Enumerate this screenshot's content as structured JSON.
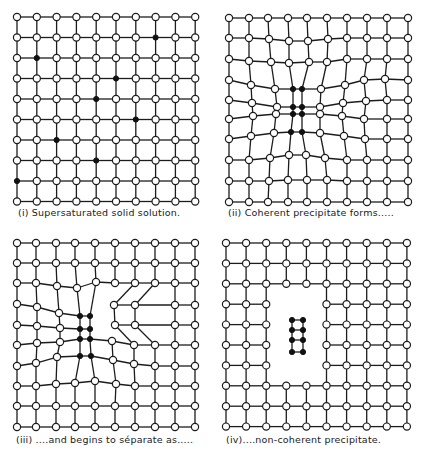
{
  "figure": {
    "colors": {
      "line": "#1c1c1c",
      "solvent_atom_fill": "#ffffff",
      "solute_atom_fill": "#111111",
      "background": "#ffffff"
    },
    "panels": [
      {
        "id": "i",
        "caption": "(i) Supersaturated solid solution.",
        "caption_pos": [
          18,
          207
        ],
        "type": "regular",
        "origin": [
          17,
          17
        ],
        "step": [
          19.8,
          20.5
        ],
        "cols": 10,
        "rows": 10,
        "solute_atoms": [
          [
            7,
            1
          ],
          [
            1,
            2
          ],
          [
            5,
            3
          ],
          [
            4,
            4
          ],
          [
            6,
            5
          ],
          [
            2,
            6
          ],
          [
            4,
            7
          ],
          [
            0,
            8
          ]
        ],
        "missing": []
      },
      {
        "id": "ii",
        "caption": "(ii) Coherent precipitate forms.....",
        "caption_pos": [
          228,
          207
        ],
        "type": "custom",
        "nodes": [
          [
            [
              229,
              18
            ],
            [
              249,
              18
            ],
            [
              268,
              18
            ],
            [
              288,
              18
            ],
            [
              307,
              18
            ],
            [
              327,
              18
            ],
            [
              347,
              18
            ],
            [
              367,
              18
            ],
            [
              387,
              18
            ],
            [
              408,
              18
            ]
          ],
          [
            [
              229,
              38
            ],
            [
              249,
              38
            ],
            [
              269,
              39
            ],
            [
              289,
              41
            ],
            [
              308,
              41
            ],
            [
              328,
              39
            ],
            [
              347,
              38
            ],
            [
              367,
              38
            ],
            [
              387,
              38
            ],
            [
              408,
              38
            ]
          ],
          [
            [
              229,
              59
            ],
            [
              249,
              61
            ],
            [
              271,
              62
            ],
            [
              289,
              63
            ],
            [
              309,
              62
            ],
            [
              327,
              62
            ],
            [
              347,
              59
            ],
            [
              367,
              59
            ],
            [
              387,
              59
            ],
            [
              408,
              59
            ]
          ],
          [
            [
              229,
              80
            ],
            [
              251,
              85
            ],
            [
              275,
              89
            ],
            [
              293,
              89
            ],
            [
              302,
              89
            ],
            [
              321,
              89
            ],
            [
              345,
              85
            ],
            [
              364,
              80
            ],
            [
              385,
              79
            ],
            [
              408,
              80
            ]
          ],
          [
            [
              229,
              100
            ],
            [
              252,
              103
            ],
            [
              277,
              107
            ],
            [
              293,
              107
            ],
            [
              302,
              107
            ],
            [
              320,
              107
            ],
            [
              343,
              103
            ],
            [
              366,
              101
            ],
            [
              387,
              100
            ],
            [
              408,
              100
            ]
          ],
          [
            [
              229,
              119
            ],
            [
              253,
              116
            ],
            [
              276,
              114
            ],
            [
              293,
              114
            ],
            [
              302,
              114
            ],
            [
              320,
              114
            ],
            [
              342,
              116
            ],
            [
              364,
              119
            ],
            [
              387,
              119
            ],
            [
              408,
              119
            ]
          ],
          [
            [
              229,
              139
            ],
            [
              251,
              136
            ],
            [
              274,
              133
            ],
            [
              291,
              132
            ],
            [
              302,
              132
            ],
            [
              320,
              133
            ],
            [
              344,
              136
            ],
            [
              365,
              139
            ],
            [
              387,
              139
            ],
            [
              408,
              139
            ]
          ],
          [
            [
              229,
              160
            ],
            [
              249,
              160
            ],
            [
              270,
              158
            ],
            [
              289,
              155
            ],
            [
              306,
              155
            ],
            [
              325,
              158
            ],
            [
              347,
              160
            ],
            [
              367,
              160
            ],
            [
              387,
              160
            ],
            [
              408,
              160
            ]
          ],
          [
            [
              229,
              181
            ],
            [
              249,
              181
            ],
            [
              269,
              181
            ],
            [
              288,
              180
            ],
            [
              307,
              180
            ],
            [
              327,
              180
            ],
            [
              347,
              181
            ],
            [
              367,
              181
            ],
            [
              387,
              181
            ],
            [
              408,
              181
            ]
          ],
          [
            [
              229,
              202
            ],
            [
              249,
              202
            ],
            [
              268,
              202
            ],
            [
              288,
              202
            ],
            [
              307,
              202
            ],
            [
              327,
              202
            ],
            [
              347,
              202
            ],
            [
              367,
              202
            ],
            [
              387,
              202
            ],
            [
              408,
              202
            ]
          ]
        ],
        "solute_atoms": [
          [
            3,
            3
          ],
          [
            4,
            3
          ],
          [
            3,
            4
          ],
          [
            4,
            4
          ],
          [
            3,
            5
          ],
          [
            4,
            5
          ],
          [
            3,
            6
          ],
          [
            4,
            6
          ]
        ],
        "missing": []
      },
      {
        "id": "iii",
        "caption": "(iii) ....and begins to séparate as.....",
        "caption_pos": [
          16,
          434
        ],
        "type": "custom",
        "nodes": [
          [
            [
              17,
              243
            ],
            [
              36,
              243
            ],
            [
              56,
              243
            ],
            [
              75,
              243
            ],
            [
              95,
              243
            ],
            [
              115,
              243
            ],
            [
              135,
              243
            ],
            [
              155,
              243
            ],
            [
              175,
              243
            ],
            [
              195,
              243
            ]
          ],
          [
            [
              17,
              263
            ],
            [
              36,
              263
            ],
            [
              56,
              263
            ],
            [
              75,
              263
            ],
            [
              95,
              263
            ],
            [
              115,
              263
            ],
            [
              135,
              263
            ],
            [
              155,
              263
            ],
            [
              175,
              263
            ],
            [
              195,
              263
            ]
          ],
          [
            [
              17,
              283
            ],
            [
              36,
              283
            ],
            [
              57,
              286
            ],
            [
              77,
              288
            ],
            [
              96,
              282
            ],
            [
              115,
              283
            ],
            [
              135,
              283
            ],
            [
              155,
              283
            ],
            [
              175,
              283
            ],
            [
              195,
              283
            ]
          ],
          [
            [
              17,
              304
            ],
            [
              37,
              307
            ],
            [
              59,
              313
            ],
            [
              80,
              316
            ],
            [
              90,
              316
            ],
            null,
            [
              114,
              305
            ],
            [
              135,
              305
            ],
            [
              155,
              305
            ],
            [
              195,
              305
            ]
          ],
          [
            [
              17,
              325
            ],
            [
              37,
              326
            ],
            [
              60,
              328
            ],
            [
              80,
              329
            ],
            [
              90,
              329
            ],
            null,
            [
              115,
              325
            ],
            [
              135,
              325
            ],
            [
              155,
              325
            ],
            [
              195,
              325
            ]
          ],
          [
            [
              17,
              345
            ],
            [
              37,
              343
            ],
            [
              60,
              342
            ],
            [
              80,
              339
            ],
            [
              90,
              339
            ],
            [
              112,
              341
            ],
            [
              134,
              345
            ],
            [
              155,
              345
            ],
            [
              175,
              345
            ],
            [
              195,
              345
            ]
          ],
          [
            [
              17,
              366
            ],
            [
              36,
              363
            ],
            [
              57,
              357
            ],
            [
              80,
              356
            ],
            [
              91,
              356
            ],
            [
              113,
              360
            ],
            [
              134,
              364
            ],
            [
              155,
              366
            ],
            [
              175,
              366
            ],
            [
              195,
              366
            ]
          ],
          [
            [
              17,
              386
            ],
            [
              36,
              386
            ],
            [
              56,
              384
            ],
            [
              75,
              383
            ],
            [
              95,
              381
            ],
            [
              116,
              384
            ],
            [
              135,
              386
            ],
            [
              155,
              386
            ],
            [
              175,
              386
            ],
            [
              195,
              386
            ]
          ],
          [
            [
              17,
              406
            ],
            [
              36,
              406
            ],
            [
              56,
              406
            ],
            [
              75,
              406
            ],
            [
              95,
              406
            ],
            [
              115,
              406
            ],
            [
              135,
              406
            ],
            [
              155,
              406
            ],
            [
              175,
              406
            ],
            [
              195,
              406
            ]
          ],
          [
            [
              17,
              427
            ],
            [
              36,
              427
            ],
            [
              56,
              427
            ],
            [
              75,
              427
            ],
            [
              95,
              427
            ],
            [
              115,
              427
            ],
            [
              135,
              427
            ],
            [
              155,
              427
            ],
            [
              175,
              427
            ],
            [
              195,
              427
            ]
          ]
        ],
        "solute_atoms": [
          [
            3,
            3
          ],
          [
            4,
            3
          ],
          [
            3,
            4
          ],
          [
            4,
            4
          ],
          [
            3,
            5
          ],
          [
            4,
            5
          ],
          [
            3,
            6
          ],
          [
            4,
            6
          ]
        ],
        "missing": [
          [
            8,
            3
          ],
          [
            8,
            4
          ]
        ],
        "extra_nodes": [
          [
            175,
            305
          ],
          [
            175,
            325
          ]
        ],
        "cut_edges": [
          [
            [
              4,
              3
            ],
            [
              5,
              3
            ]
          ],
          [
            [
              5,
              2
            ],
            [
              5,
              3
            ]
          ]
        ]
      },
      {
        "id": "iv",
        "caption": "(iv)....non-coherent precipitate.",
        "caption_pos": [
          226,
          434
        ],
        "type": "regular",
        "origin": [
          226,
          243
        ],
        "step": [
          20.1,
          20.4
        ],
        "cols": 10,
        "rows": 10,
        "solute_atoms": [],
        "missing": [
          [
            3,
            3
          ],
          [
            4,
            3
          ],
          [
            3,
            4
          ],
          [
            4,
            4
          ],
          [
            3,
            5
          ],
          [
            4,
            5
          ],
          [
            3,
            6
          ],
          [
            4,
            6
          ]
        ],
        "precipitate": {
          "nodes": [
            [
              292,
              320
            ],
            [
              303,
              320
            ],
            [
              292,
              330
            ],
            [
              303,
              330
            ],
            [
              292,
              340
            ],
            [
              303,
              340
            ],
            [
              292,
              352
            ],
            [
              303,
              352
            ]
          ],
          "rows": 4
        }
      }
    ]
  }
}
